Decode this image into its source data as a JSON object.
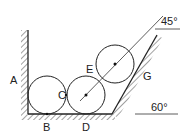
{
  "diagram": {
    "type": "mechanics-figure",
    "labels": {
      "A": "A",
      "B": "B",
      "C": "C",
      "D": "D",
      "E": "E",
      "G": "G"
    },
    "angles": {
      "upper": "45°",
      "lower": "60°"
    },
    "colors": {
      "stroke": "#222222",
      "background": "#ffffff"
    }
  }
}
